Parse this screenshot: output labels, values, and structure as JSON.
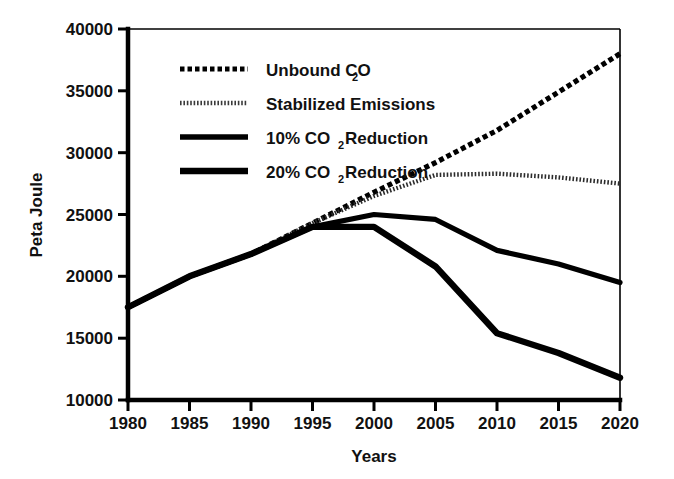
{
  "chart_data": {
    "type": "line",
    "title": "",
    "xlabel": "Years",
    "ylabel": "Peta Joule",
    "x": [
      1980,
      1985,
      1990,
      1995,
      2000,
      2005,
      2010,
      2015,
      2020
    ],
    "xticklabels": [
      "1980",
      "1985",
      "1990",
      "1995",
      "2000",
      "2005",
      "2010",
      "2015",
      "2020"
    ],
    "yticklabels": [
      "10000",
      "15000",
      "20000",
      "25000",
      "30000",
      "35000",
      "40000"
    ],
    "ytickvalues": [
      10000,
      15000,
      20000,
      25000,
      30000,
      35000,
      40000
    ],
    "xlim": [
      1980,
      2020
    ],
    "ylim": [
      10000,
      40000
    ],
    "grid": false,
    "legend_position": "upper-left-inside",
    "series": [
      {
        "name": "Unbound CO2",
        "label": "Unbound CO",
        "label_sub": "2",
        "style": "coarse-dashed",
        "values": [
          17500,
          20000,
          21800,
          24300,
          26800,
          29200,
          31800,
          34900,
          38000
        ]
      },
      {
        "name": "Stabilized Emissions",
        "label": "Stabilized Emissions",
        "label_sub": "",
        "style": "fine-dotted",
        "values": [
          17500,
          20000,
          21800,
          24300,
          26500,
          28200,
          28300,
          28000,
          27500
        ]
      },
      {
        "name": "10% CO2 Reduction",
        "label": "10% CO",
        "label_sub": "2",
        "label_tail": " Reduction",
        "style": "solid-thin",
        "values": [
          17500,
          20000,
          21800,
          24000,
          25000,
          24600,
          22100,
          21000,
          19500
        ]
      },
      {
        "name": "20% CO2 Reduction",
        "label": "20% CO",
        "label_sub": "2",
        "label_tail": " Reduction",
        "style": "solid-thick",
        "values": [
          17500,
          20000,
          21800,
          24000,
          24000,
          20800,
          15400,
          13800,
          11800
        ]
      }
    ]
  },
  "axes": {
    "ylabel": "Peta Joule",
    "xlabel": "Years",
    "ytick_0": "10000",
    "ytick_1": "15000",
    "ytick_2": "20000",
    "ytick_3": "25000",
    "ytick_4": "30000",
    "ytick_5": "35000",
    "ytick_6": "40000",
    "xtick_0": "1980",
    "xtick_1": "1985",
    "xtick_2": "1990",
    "xtick_3": "1995",
    "xtick_4": "2000",
    "xtick_5": "2005",
    "xtick_6": "2010",
    "xtick_7": "2015",
    "xtick_8": "2020"
  },
  "legend": {
    "item_0_label": "Unbound CO",
    "item_0_sub": "2",
    "item_1_label": "Stabilized Emissions",
    "item_2_label": "10% CO",
    "item_2_sub": "2",
    "item_2_tail": " Reduction",
    "item_3_label": "20% CO",
    "item_3_sub": "2",
    "item_3_tail": " Reduction"
  },
  "colors": {
    "ink": "#000000",
    "background": "#ffffff"
  }
}
